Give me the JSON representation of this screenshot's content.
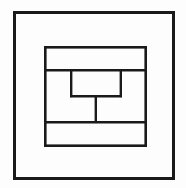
{
  "page": {
    "background_color": "#fdfdfd",
    "width": 186,
    "height": 188,
    "caption": ""
  },
  "style": {
    "stroke_color": "#1a1a1a",
    "outer_stroke_width": 3,
    "inner_stroke_width": 2.6,
    "divider_stroke_width": 2.4,
    "stem_stroke_width": 2.4,
    "fill_color": "none"
  },
  "chart_data": {
    "type": "diagram",
    "xlim": [
      0,
      186
    ],
    "ylim": [
      0,
      188
    ],
    "grid": false,
    "legend": null,
    "shapes": [
      {
        "name": "outer-frame",
        "kind": "rect",
        "x": 13,
        "y": 11,
        "width": 162,
        "height": 169,
        "stroke_width": 3
      },
      {
        "name": "inner-frame",
        "kind": "rect",
        "x": 44,
        "y": 46,
        "width": 103,
        "height": 101,
        "stroke_width": 2.6
      },
      {
        "name": "upper-divider",
        "kind": "line",
        "x1": 44,
        "y1": 70,
        "x2": 147,
        "y2": 70,
        "stroke_width": 2.4
      },
      {
        "name": "center-box",
        "kind": "rect",
        "x": 70,
        "y": 70,
        "width": 52,
        "height": 27,
        "stroke_width": 2.4
      },
      {
        "name": "center-stem",
        "kind": "line",
        "x1": 96,
        "y1": 97,
        "x2": 96,
        "y2": 122,
        "stroke_width": 2.4
      },
      {
        "name": "lower-divider",
        "kind": "line",
        "x1": 44,
        "y1": 122,
        "x2": 147,
        "y2": 122,
        "stroke_width": 2.4
      }
    ],
    "regions": [
      {
        "name": "outer-margin-band",
        "label": ""
      },
      {
        "name": "top-band",
        "label": ""
      },
      {
        "name": "middle-band-left",
        "label": ""
      },
      {
        "name": "middle-band-right",
        "label": ""
      },
      {
        "name": "center-box-region",
        "label": ""
      },
      {
        "name": "bottom-band",
        "label": ""
      }
    ]
  }
}
